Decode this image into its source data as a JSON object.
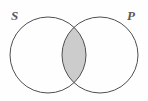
{
  "diagram": {
    "type": "venn-diagram",
    "title": "",
    "background_color": "#fefefe",
    "stroke_color": "#4f4f4f",
    "stroke_width": 1,
    "shaded_region": {
      "name": "intersection",
      "label": "S and P",
      "fill_color": "#cccccc",
      "description": "overlap of the two circles is shaded gray"
    },
    "sets": [
      {
        "id": "S",
        "label": "S",
        "position": "left",
        "cx": 48,
        "cy": 55,
        "r": 38,
        "fill": "none"
      },
      {
        "id": "P",
        "label": "P",
        "position": "right",
        "cx": 100,
        "cy": 55,
        "r": 38,
        "fill": "none"
      }
    ],
    "labels": [
      {
        "text": "S",
        "x": 11,
        "y": 9
      },
      {
        "text": "P",
        "x": 127,
        "y": 9
      }
    ]
  }
}
